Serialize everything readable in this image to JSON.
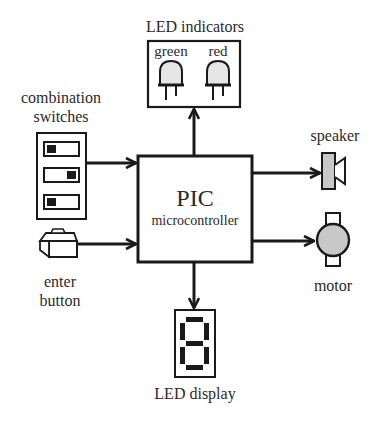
{
  "diagram": {
    "central_block": {
      "title": "PIC",
      "subtitle": "microcontroller"
    },
    "inputs": [
      {
        "id": "combination-switches",
        "label_lines": [
          "combination",
          "switches"
        ],
        "switch_positions": [
          "left",
          "right",
          "left"
        ]
      },
      {
        "id": "enter-button",
        "label_lines": [
          "enter",
          "button"
        ]
      }
    ],
    "outputs": [
      {
        "id": "led-indicators",
        "label": "LED indicators",
        "leds": [
          "green",
          "red"
        ]
      },
      {
        "id": "speaker",
        "label": "speaker"
      },
      {
        "id": "motor",
        "label": "motor"
      },
      {
        "id": "led-display",
        "label": "LED display",
        "digit": "8"
      }
    ],
    "colors": {
      "line": "#1a1a1a",
      "fill_gray": "#c8c8c8",
      "led_fill": "#e6e6e6",
      "background": "#ffffff"
    }
  }
}
